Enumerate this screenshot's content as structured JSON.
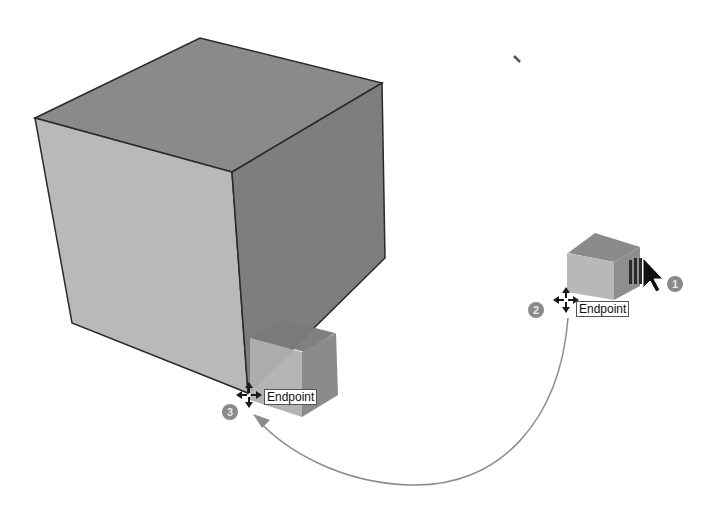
{
  "scene": {
    "description": "Move tool copy operation: small cube copied from right to corner of large cube",
    "colors": {
      "top_face": "#8a8a8a",
      "front_face": "#b9b9b9",
      "side_face": "#7d7d7d",
      "edge": "#2a2a2a",
      "arc": "#8c8c8c",
      "marker": "#8a8a8a"
    }
  },
  "inference_tooltips": [
    {
      "label": "Endpoint",
      "position": "source"
    },
    {
      "label": "Endpoint",
      "position": "destination"
    }
  ],
  "steps": [
    {
      "number": "1",
      "description": "Move/copy cursor"
    },
    {
      "number": "2",
      "description": "Pick source endpoint"
    },
    {
      "number": "3",
      "description": "Place at destination endpoint"
    }
  ]
}
